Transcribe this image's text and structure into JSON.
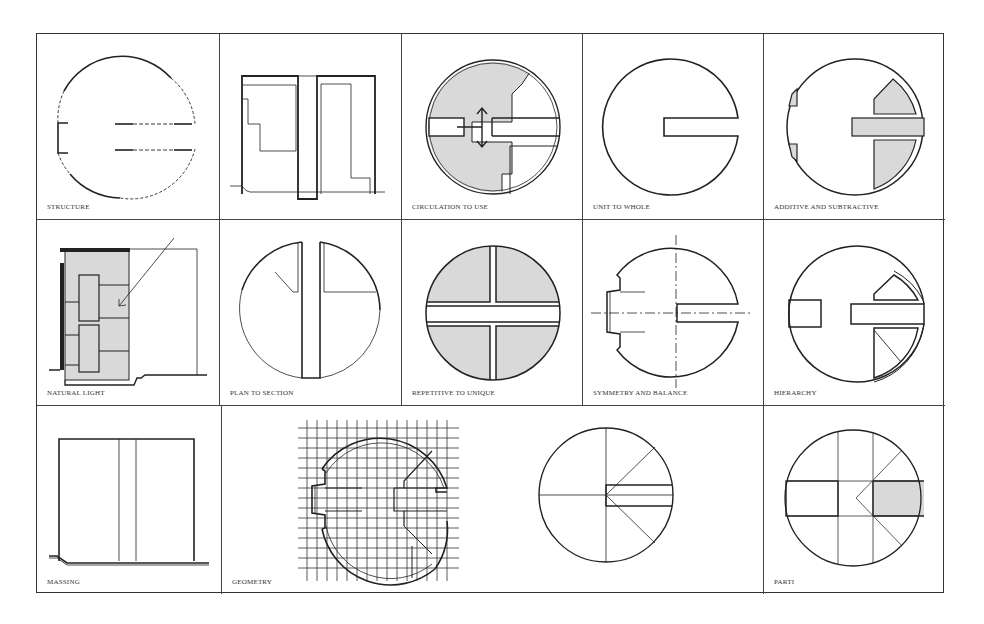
{
  "cells": {
    "structure": {
      "label": "STRUCTURE"
    },
    "section": {
      "label": ""
    },
    "circulation": {
      "label": "CIRCULATION TO USE"
    },
    "unit_whole": {
      "label": "UNIT TO WHOLE"
    },
    "additive": {
      "label": "ADDITIVE AND SUBTRACTIVE"
    },
    "natural_light": {
      "label": "NATURAL LIGHT"
    },
    "plan_section": {
      "label": "PLAN TO SECTION"
    },
    "repetitive": {
      "label": "REPETITIVE TO UNIQUE"
    },
    "symmetry": {
      "label": "SYMMETRY AND BALANCE"
    },
    "hierarchy": {
      "label": "HIERARCHY"
    },
    "massing": {
      "label": "MASSING"
    },
    "geometry": {
      "label": "GEOMETRY"
    },
    "parti": {
      "label": "PARTI"
    }
  },
  "colors": {
    "line": "#222222",
    "fill": "#d9d9d9",
    "frame": "#444444",
    "background": "#ffffff"
  }
}
